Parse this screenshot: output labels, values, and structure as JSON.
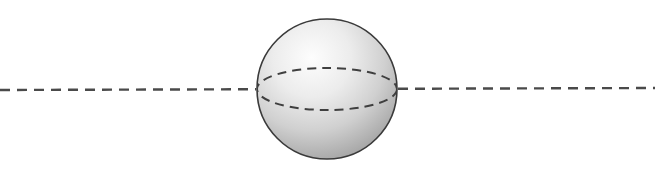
{
  "figure": {
    "name": "sphere-with-equator-and-axis",
    "canvas": {
      "width": 655,
      "height": 173,
      "background": "#ffffff"
    },
    "caption": "",
    "sphere": {
      "label": "sphere",
      "center_x": 327,
      "center_y": 89,
      "radius": 70,
      "outline_color": "#3a3a3a",
      "outline_width": 1.6,
      "fill_light": "#fdfdfd",
      "fill_mid": "#d0d0d0",
      "fill_dark": "#9d9d9d",
      "highlight_x": 312,
      "highlight_y": 58
    },
    "equator": {
      "label": "equator-ellipse",
      "center_x": 327,
      "center_y": 89,
      "radius_x": 70,
      "radius_y": 21,
      "stroke_color": "#3f3f3f",
      "stroke_width": 2,
      "dash": "9 6"
    },
    "axis": {
      "label": "horizontal-axis-line",
      "x_start": 0,
      "x_end": 655,
      "y_left": 90,
      "y_right": 88,
      "stroke_color": "#4a4a4a",
      "stroke_width": 2.4,
      "dash": "10 7"
    }
  }
}
